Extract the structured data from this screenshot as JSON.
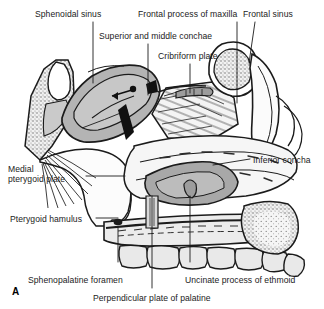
{
  "figure": {
    "panel_letter": "A",
    "background_color": "#ffffff",
    "ink_color": "#1b1b1b",
    "bone_fill": "#eeeeee",
    "mucosa_fill": "#b9b9b9",
    "sinus_stipple": "#777777"
  },
  "labels": [
    {
      "id": "sphenoidal-sinus",
      "text": "Sphenoidal sinus",
      "x": 35,
      "y": 9,
      "align": "left",
      "width": 100
    },
    {
      "id": "frontal-process-of-maxilla",
      "text": "Frontal process of maxilla",
      "x": 138,
      "y": 9,
      "align": "left",
      "width": 100
    },
    {
      "id": "frontal-sinus",
      "text": "Frontal sinus",
      "x": 243,
      "y": 9,
      "align": "left",
      "width": 100
    },
    {
      "id": "superior-and-middle-conchae",
      "text": "Superior and middle conchae",
      "x": 99,
      "y": 31,
      "align": "left",
      "width": 100
    },
    {
      "id": "cribriform-plate",
      "text": "Cribriform plate",
      "x": 158,
      "y": 51,
      "align": "left",
      "width": 100
    },
    {
      "id": "medial-pterygoid-plate",
      "text": "Medial\npterygoid plate",
      "x": 8,
      "y": 164,
      "align": "left",
      "width": 76
    },
    {
      "id": "inferior-concha",
      "text": "Inferior concha",
      "x": 253,
      "y": 155,
      "align": "left",
      "width": 100
    },
    {
      "id": "pterygoid-hamulus",
      "text": "Pterygoid hamulus",
      "x": 10,
      "y": 214,
      "align": "left",
      "width": 100
    },
    {
      "id": "sphenopalatine-foramen",
      "text": "Sphenopalatine foramen",
      "x": 28,
      "y": 275,
      "align": "left",
      "width": 120
    },
    {
      "id": "uncinate-process-of-ethmoid",
      "text": "Uncinate process of ethmoid",
      "x": 185,
      "y": 275,
      "align": "left",
      "width": 130
    },
    {
      "id": "perpendicular-plate-of-palatine",
      "text": "Perpendicular plate of palatine",
      "x": 93,
      "y": 293,
      "align": "left",
      "width": 150
    }
  ],
  "label_lines": [
    {
      "id": "leader-sphenoidal-sinus",
      "x1": 93,
      "y1": 22,
      "x2": 93,
      "y2": 83
    },
    {
      "id": "leader-superior-middle-conchae",
      "x1": 148,
      "y1": 44,
      "x2": 148,
      "y2": 95
    },
    {
      "id": "leader-cribriform-plate",
      "x1": 190,
      "y1": 64,
      "x2": 190,
      "y2": 93
    },
    {
      "id": "leader-frontal-process-of-maxilla",
      "x1": 237,
      "y1": 22,
      "x2": 237,
      "y2": 103
    },
    {
      "id": "leader-frontal-sinus",
      "x1": 255,
      "y1": 22,
      "x2": 249,
      "y2": 63
    },
    {
      "id": "leader-medial-pterygoid-plate",
      "x1": 86,
      "y1": 176,
      "x2": 125,
      "y2": 176
    },
    {
      "id": "leader-inferior-concha",
      "x1": 250,
      "y1": 159,
      "x2": 213,
      "y2": 165
    },
    {
      "id": "leader-pterygoid-hamulus",
      "x1": 96,
      "y1": 218,
      "x2": 118,
      "y2": 218
    },
    {
      "id": "leader-sphenopalatine-foramen",
      "x1": 118,
      "y1": 262,
      "x2": 118,
      "y2": 228
    },
    {
      "id": "leader-perpendicular-plate",
      "x1": 152,
      "y1": 288,
      "x2": 152,
      "y2": 196
    },
    {
      "id": "leader-uncinate-process",
      "x1": 190,
      "y1": 262,
      "x2": 190,
      "y2": 196
    }
  ]
}
